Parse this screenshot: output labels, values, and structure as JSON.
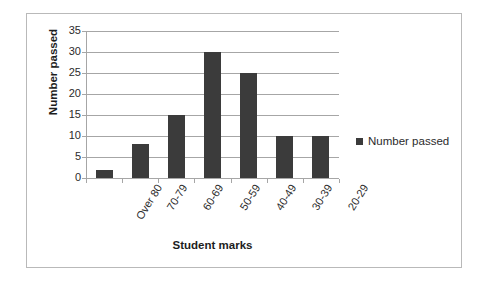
{
  "chart_data": {
    "type": "bar",
    "title": "",
    "categories": [
      "Over 80",
      "70-79",
      "60-69",
      "50-59",
      "40-49",
      "30-39",
      "20-29"
    ],
    "values": [
      2,
      8,
      15,
      30,
      25,
      10,
      10
    ],
    "series": [
      {
        "name": "Number passed",
        "values": [
          2,
          8,
          15,
          30,
          25,
          10,
          10
        ]
      }
    ],
    "xlabel": "Student marks",
    "ylabel": "Number passed",
    "ylim": [
      0,
      35
    ],
    "yticks": [
      0,
      5,
      10,
      15,
      20,
      25,
      30,
      35
    ],
    "ytick_labels": [
      "0",
      "5",
      "10",
      "15",
      "20",
      "25",
      "30",
      "35"
    ],
    "grid": true,
    "grid_axis": "y",
    "legend": [
      "Number passed"
    ],
    "legend_position": "right",
    "bar_color": "#3b3b3b",
    "grid_color": "#a6a6a6",
    "border_color": "#b9b9b9",
    "xtick_label_rotation": -58
  }
}
